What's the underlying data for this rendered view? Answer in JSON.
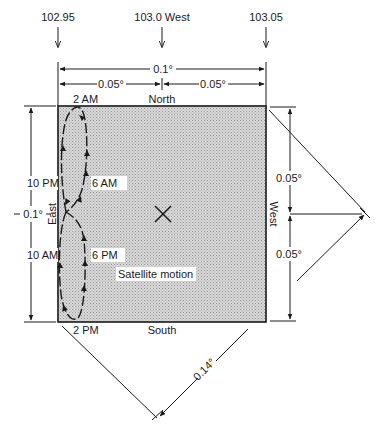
{
  "diagram": {
    "longitude_markers": [
      {
        "label": "102.95",
        "x": 58
      },
      {
        "label": "103.0 West",
        "x": 162
      },
      {
        "label": "103.05",
        "x": 266
      }
    ],
    "dimensions": {
      "top_total": "0.1°",
      "top_left_half": "0.05°",
      "top_right_half": "0.05°",
      "left_total": "0.1°",
      "right_upper_half": "0.05°",
      "right_lower_half": "0.05°",
      "diagonal": "0.14°"
    },
    "sides": {
      "north": "North",
      "south": "South",
      "east": "East",
      "west": "West"
    },
    "time_labels": {
      "t_2am": "2 AM",
      "t_6am": "6 AM",
      "t_10pm": "10 PM",
      "t_10am": "10 AM",
      "t_6pm": "6 PM",
      "t_2pm": "2 PM"
    },
    "annotations": {
      "center_mark": "×",
      "motion_label": "Satellite motion"
    },
    "colors": {
      "ink": "#1a1a1a",
      "box_fill": "#cfcfcf",
      "background": "#ffffff"
    }
  }
}
